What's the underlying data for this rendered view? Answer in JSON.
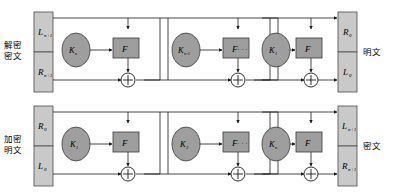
{
  "diagram": {
    "colors": {
      "register_fill": "#c9c9c9",
      "function_fill": "#9e9e9e",
      "key_fill": "#9e9e9e",
      "wire": "#1a1a1a",
      "background": "#ffffff"
    },
    "ellipsis": "···"
  },
  "decrypt_row": {
    "side_label_line1": "解密",
    "side_label_line2": "密文",
    "output_label": "明文",
    "input_register_top": {
      "base": "L",
      "sub": "n+1"
    },
    "input_register_bottom": {
      "base": "R",
      "sub": "n+1"
    },
    "output_register_top": {
      "base": "R",
      "sub": "0"
    },
    "output_register_bottom": {
      "base": "L",
      "sub": "0"
    },
    "stages": [
      {
        "key_base": "K",
        "key_sub": "n",
        "function_label": "F",
        "xor_label": "⊕"
      },
      {
        "key_base": "K",
        "key_sub": "n-1",
        "function_label": "F",
        "xor_label": "⊕"
      },
      {
        "key_base": "K",
        "key_sub": "1",
        "function_label": "F",
        "xor_label": "⊕"
      }
    ]
  },
  "encrypt_row": {
    "side_label_line1": "加密",
    "side_label_line2": "明文",
    "output_label": "密文",
    "input_register_top": {
      "base": "R",
      "sub": "0"
    },
    "input_register_bottom": {
      "base": "L",
      "sub": "0"
    },
    "output_register_top": {
      "base": "L",
      "sub": "n+1"
    },
    "output_register_bottom": {
      "base": "R",
      "sub": "n+1"
    },
    "stages": [
      {
        "key_base": "K",
        "key_sub": "1",
        "function_label": "F",
        "xor_label": "⊕"
      },
      {
        "key_base": "K",
        "key_sub": "2",
        "function_label": "F",
        "xor_label": "⊕"
      },
      {
        "key_base": "K",
        "key_sub": "n",
        "function_label": "F",
        "xor_label": "⊕"
      }
    ]
  }
}
